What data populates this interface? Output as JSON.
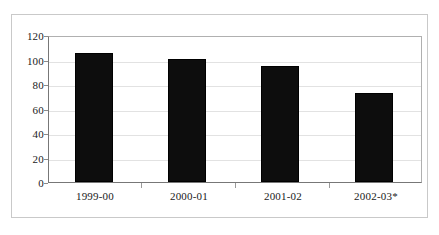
{
  "chart_data": {
    "type": "bar",
    "title": "",
    "subtitle": "",
    "xlabel": "",
    "ylabel": "",
    "categories": [
      "1999-00",
      "2000-01",
      "2001-02",
      "2002-03*"
    ],
    "values": [
      107,
      102,
      96,
      74
    ],
    "series": [
      {
        "name": "",
        "values": [
          107,
          102,
          96,
          74
        ]
      }
    ],
    "ylim": [
      0,
      120
    ],
    "y_ticks": [
      "0",
      "20",
      "40",
      "60",
      "80",
      "100",
      "120"
    ],
    "y_tick_values": [
      0,
      20,
      40,
      60,
      80,
      100,
      120
    ],
    "grid": true,
    "grid_axis": "y",
    "legend": false,
    "legend_position": "none",
    "annotations": [],
    "bar_color": "#0d0d0d",
    "plot_background": "#ffffff",
    "grid_color": "#e2e2e2",
    "axis_color": "#777777",
    "frame_color": "#c9c9c9",
    "text_color": "#1a1a1a",
    "footnote_marker": "*"
  }
}
